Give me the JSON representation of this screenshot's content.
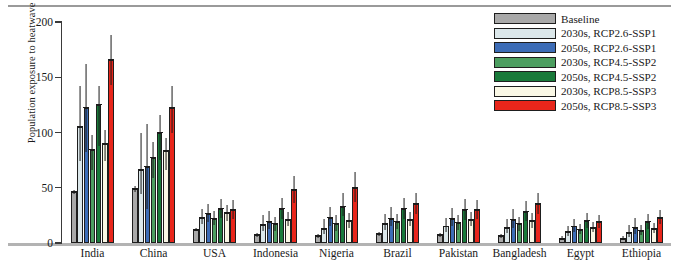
{
  "chart_data": {
    "type": "bar",
    "title": "",
    "xlabel": "",
    "ylabel": "Population exposure to heatwave (10⁹ person-day)",
    "ylabel_prefix": "Population exposure to heatwave (10",
    "ylabel_exponent": "9",
    "ylabel_suffix": " person-day)",
    "ylim": [
      0,
      200
    ],
    "yticks": [
      0,
      50,
      100,
      150,
      200
    ],
    "ytick_labels": [
      "0",
      "50",
      "100",
      "150",
      "200"
    ],
    "grid": false,
    "legend_position": "top-right",
    "categories": [
      "India",
      "China",
      "USA",
      "Indonesia",
      "Nigeria",
      "Brazil",
      "Pakistan",
      "Bangladesh",
      "Egypt",
      "Ethiopia"
    ],
    "series": [
      {
        "name": "Baseline",
        "color": "#a9a9a9",
        "values": [
          46,
          49,
          12,
          7,
          6,
          8,
          7,
          6,
          4,
          4
        ],
        "err_low": [
          44,
          46,
          10.5,
          5.5,
          4.5,
          6.5,
          5.5,
          4.5,
          3,
          3
        ],
        "err_high": [
          48,
          52,
          14,
          9,
          8,
          10,
          9,
          8,
          6,
          6
        ]
      },
      {
        "name": "2030s, RCP2.6-SSP1",
        "color": "#dbe7ea",
        "values": [
          105,
          66,
          23,
          16,
          13,
          17,
          15,
          14,
          10,
          9
        ],
        "err_low": [
          74,
          44,
          17,
          11,
          8,
          12,
          10,
          9,
          6,
          5
        ],
        "err_high": [
          142,
          100,
          31,
          25,
          22,
          26,
          23,
          22,
          15,
          16
        ]
      },
      {
        "name": "2050s, RCP2.6-SSP1",
        "color": "#3c6cb6",
        "values": [
          122,
          69,
          26,
          19,
          23,
          22,
          22,
          21,
          15,
          14
        ],
        "err_low": [
          82,
          31,
          19,
          13,
          15,
          15,
          15,
          14,
          10,
          8
        ],
        "err_high": [
          162,
          108,
          35,
          29,
          33,
          33,
          32,
          31,
          22,
          23
        ]
      },
      {
        "name": "2030s, RCP4.5-SSP2",
        "color": "#4c9e60",
        "values": [
          84,
          77,
          22,
          17,
          17,
          19,
          18,
          17,
          12,
          11
        ],
        "err_low": [
          66,
          59,
          16,
          11,
          11,
          13,
          12,
          11,
          8,
          7
        ],
        "err_high": [
          98,
          91,
          29,
          24,
          25,
          26,
          25,
          24,
          17,
          16
        ]
      },
      {
        "name": "2050s, RCP4.5-SSP2",
        "color": "#197a3a",
        "values": [
          125,
          100,
          31,
          31,
          33,
          31,
          30,
          28,
          20,
          19
        ],
        "err_low": [
          88,
          75,
          23,
          22,
          24,
          22,
          21,
          20,
          14,
          13
        ],
        "err_high": [
          142,
          116,
          40,
          41,
          45,
          41,
          40,
          38,
          27,
          26
        ]
      },
      {
        "name": "2030s, RCP8.5-SSP3",
        "color": "#faf8e6",
        "values": [
          90,
          83,
          27,
          21,
          20,
          21,
          21,
          20,
          14,
          13
        ],
        "err_low": [
          74,
          66,
          20,
          15,
          14,
          15,
          15,
          14,
          10,
          9
        ],
        "err_high": [
          102,
          95,
          34,
          28,
          27,
          28,
          28,
          27,
          19,
          18
        ]
      },
      {
        "name": "2050s, RCP8.5-SSP3",
        "color": "#e8261b",
        "values": [
          166,
          122,
          30,
          48,
          50,
          35,
          30,
          35,
          19,
          23
        ],
        "err_low": [
          143,
          100,
          22,
          36,
          37,
          26,
          22,
          26,
          14,
          17
        ],
        "err_high": [
          188,
          142,
          39,
          61,
          64,
          45,
          39,
          45,
          25,
          30
        ]
      }
    ]
  },
  "legend": {
    "items": [
      {
        "label": "Baseline",
        "color": "#a9a9a9"
      },
      {
        "label": "2030s, RCP2.6-SSP1",
        "color": "#dbe7ea"
      },
      {
        "label": "2050s, RCP2.6-SSP1",
        "color": "#3c6cb6"
      },
      {
        "label": "2030s, RCP4.5-SSP2",
        "color": "#4c9e60"
      },
      {
        "label": "2050s, RCP4.5-SSP2",
        "color": "#197a3a"
      },
      {
        "label": "2030s, RCP8.5-SSP3",
        "color": "#faf8e6"
      },
      {
        "label": "2050s, RCP8.5-SSP3",
        "color": "#e8261b"
      }
    ]
  }
}
